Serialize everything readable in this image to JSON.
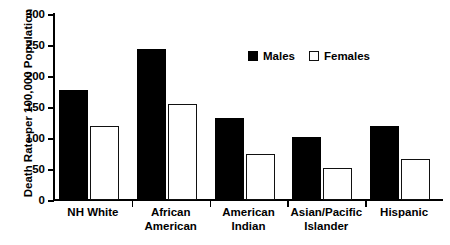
{
  "chart_data": {
    "type": "bar",
    "title": "",
    "xlabel": "",
    "ylabel": "Death Rate per 100,000 Population",
    "ylim": [
      0,
      300
    ],
    "yticks": [
      0,
      50,
      100,
      150,
      200,
      250,
      300
    ],
    "ytick_labels": [
      "0",
      "50",
      "100",
      "150",
      "200",
      "250",
      "300"
    ],
    "grid": false,
    "legend_position": "upper center-right (inside plot)",
    "categories": [
      "NH White",
      "African American",
      "American Indian",
      "Asian/Pacific Islander",
      "Hispanic"
    ],
    "category_lines": [
      [
        "NH White",
        ""
      ],
      [
        "African",
        "American"
      ],
      [
        "American",
        "Indian"
      ],
      [
        "Asian/Pacific",
        "Islander"
      ],
      [
        "Hispanic",
        ""
      ]
    ],
    "series": [
      {
        "name": "Males",
        "color": "#000000",
        "fill": "solid",
        "values": [
          177,
          243,
          132,
          101,
          119
        ]
      },
      {
        "name": "Females",
        "color": "#ffffff",
        "edge_color": "#111111",
        "fill": "open",
        "values": [
          120,
          155,
          75,
          52,
          66
        ]
      }
    ]
  },
  "legend": {
    "items": [
      {
        "label": "Males",
        "swatch": "filled-black-square"
      },
      {
        "label": "Females",
        "swatch": "open-white-square"
      }
    ]
  }
}
